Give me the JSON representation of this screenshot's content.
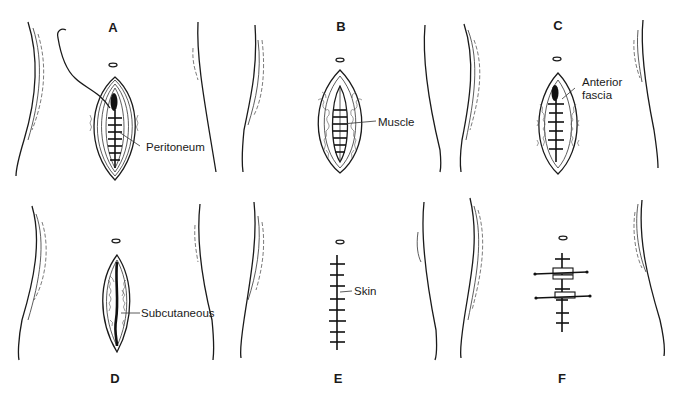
{
  "figure": {
    "panels": [
      {
        "id": "A",
        "label": "A",
        "callout": "Peritoneum",
        "layer": "peritoneum"
      },
      {
        "id": "B",
        "label": "B",
        "callout": "Muscle",
        "layer": "muscle"
      },
      {
        "id": "C",
        "label": "C",
        "callout": "Anterior fascia",
        "callout_lines": [
          "Anterior",
          "fascia"
        ],
        "layer": "anterior-fascia"
      },
      {
        "id": "D",
        "label": "D",
        "callout": "Subcutaneous",
        "layer": "subcutaneous"
      },
      {
        "id": "E",
        "label": "E",
        "callout": "Skin",
        "layer": "skin"
      },
      {
        "id": "F",
        "label": "F",
        "callout": "",
        "layer": "retention-sutures"
      }
    ]
  },
  "colors": {
    "ink": "#1a1a1a",
    "background": "#ffffff"
  }
}
